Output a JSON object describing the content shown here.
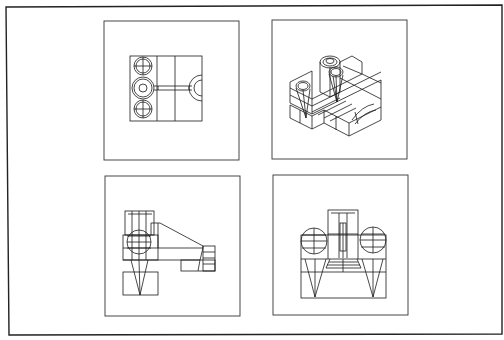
{
  "figure": {
    "type": "multiview-orthographic-drawing",
    "background": "#ffffff",
    "line_color": "#1a1a1a",
    "views": [
      {
        "id": "top-view",
        "position": "top-left",
        "label": ""
      },
      {
        "id": "isometric-view",
        "position": "top-right",
        "label": ""
      },
      {
        "id": "side-view",
        "position": "bottom-left",
        "label": ""
      },
      {
        "id": "front-view",
        "position": "bottom-right",
        "label": ""
      }
    ]
  }
}
